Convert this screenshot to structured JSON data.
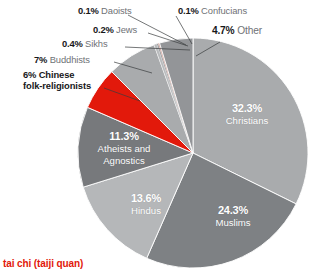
{
  "chart_data": {
    "type": "pie",
    "title": "",
    "subtitle": "",
    "xlabel": "",
    "ylabel": "",
    "legend_position": "callout-labels",
    "grid": false,
    "unit": "%",
    "center": {
      "x": 193,
      "y": 153
    },
    "radius": 115,
    "start_angle_deg": 0,
    "direction": "clockwise",
    "categories": [
      "Christians",
      "Muslims",
      "Hindus",
      "Atheists and Agnostics",
      "Chinese folk-religionists",
      "Buddhists",
      "Sikhs",
      "Jews",
      "Daoists",
      "Confucians",
      "Other"
    ],
    "values": [
      32.3,
      24.3,
      13.6,
      11.3,
      6,
      7,
      0.4,
      0.2,
      0.1,
      0.1,
      4.7
    ],
    "colors": [
      "#a9abad",
      "#7e8184",
      "#b5b7b9",
      "#77797c",
      "#e2190b",
      "#a9abad",
      "#b8babc",
      "#8e9093",
      "#c97b6d",
      "#9a5c52",
      "#939598"
    ],
    "slices": [
      {
        "label": "Christians",
        "value": 32.3,
        "display": "32.3%",
        "color": "#a9abad",
        "label_placement": "inside"
      },
      {
        "label": "Muslims",
        "value": 24.3,
        "display": "24.3%",
        "color": "#7e8184",
        "label_placement": "inside"
      },
      {
        "label": "Hindus",
        "value": 13.6,
        "display": "13.6%",
        "color": "#b5b7b9",
        "label_placement": "inside"
      },
      {
        "label": "Atheists and Agnostics",
        "value": 11.3,
        "display": "11.3%",
        "color": "#77797c",
        "label_placement": "inside"
      },
      {
        "label": "Chinese folk-religionists",
        "value": 6,
        "display": "6%",
        "color": "#e2190b",
        "label_placement": "callout"
      },
      {
        "label": "Buddhists",
        "value": 7,
        "display": "7%",
        "color": "#a9abad",
        "label_placement": "callout"
      },
      {
        "label": "Sikhs",
        "value": 0.4,
        "display": "0.4%",
        "color": "#b8babc",
        "label_placement": "callout"
      },
      {
        "label": "Jews",
        "value": 0.2,
        "display": "0.2%",
        "color": "#8e9093",
        "label_placement": "callout"
      },
      {
        "label": "Daoists",
        "value": 0.1,
        "display": "0.1%",
        "color": "#c97b6d",
        "label_placement": "callout"
      },
      {
        "label": "Confucians",
        "value": 0.1,
        "display": "0.1%",
        "color": "#9a5c52",
        "label_placement": "callout"
      },
      {
        "label": "Other",
        "value": 4.7,
        "display": "4.7%",
        "color": "#939598",
        "label_placement": "callout"
      }
    ]
  },
  "labels": {
    "daoists": {
      "value": "0.1%",
      "name": "Daoists"
    },
    "confucians": {
      "value": "0.1%",
      "name": "Confucians"
    },
    "jews": {
      "value": "0.2%",
      "name": "Jews"
    },
    "other": {
      "value": "4.7%",
      "name": "Other"
    },
    "sikhs": {
      "value": "0.4%",
      "name": "Sikhs"
    },
    "buddhists": {
      "value": "7%",
      "name": "Buddhists"
    },
    "chinese": {
      "value": "6%",
      "name": "Chinese",
      "name_line2": "folk-religionists"
    },
    "christians": {
      "value": "32.3%",
      "name": "Christians"
    },
    "muslims": {
      "value": "24.3%",
      "name": "Muslims"
    },
    "hindus": {
      "value": "13.6%",
      "name": "Hindus"
    },
    "atheists": {
      "value": "11.3%",
      "name": "Atheists and",
      "name_line2": "Agnostics"
    }
  },
  "caption": {
    "text": "tai chi (taiji quan)",
    "color": "#e2190b"
  }
}
